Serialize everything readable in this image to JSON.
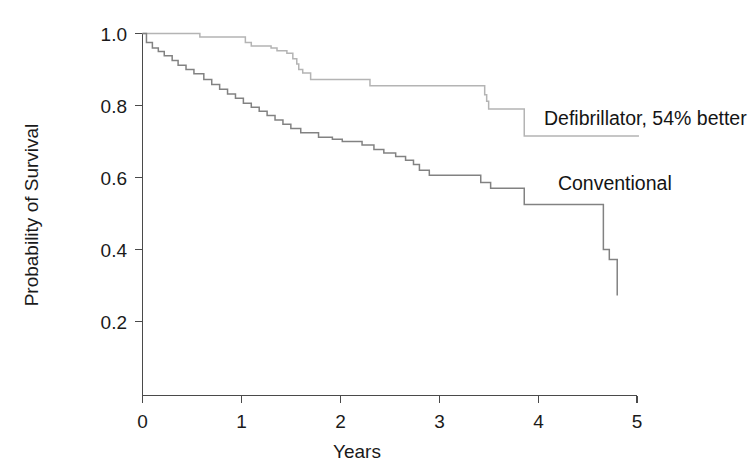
{
  "chart_data": {
    "type": "line",
    "title": "",
    "subtitle": "",
    "xlabel": "Years",
    "ylabel": "Probability of Survival",
    "xlim": [
      0,
      5
    ],
    "ylim": [
      0,
      1.05
    ],
    "xticks": [
      0,
      1,
      2,
      3,
      4,
      5
    ],
    "xtick_labels": [
      "0",
      "1",
      "2",
      "3",
      "4",
      "5"
    ],
    "yticks": [
      0.2,
      0.4,
      0.6,
      0.8,
      1.0
    ],
    "ytick_labels": [
      "0.2",
      "0.4",
      "0.6",
      "0.8",
      "1.0"
    ],
    "grid": false,
    "legend_position": "inline-annotation",
    "step_style": "post",
    "series": [
      {
        "name": "Defibrillator, 54% better",
        "color": "#b4b4b4",
        "annotation": "Defibrillator, 54% better",
        "annotation_x": 4.06,
        "annotation_y": 0.745,
        "x": [
          0.0,
          0.05,
          0.55,
          0.58,
          1.04,
          1.1,
          1.3,
          1.36,
          1.46,
          1.52,
          1.56,
          1.58,
          1.62,
          1.7,
          2.22,
          2.3,
          3.42,
          3.46,
          3.48,
          3.5,
          3.82,
          3.86,
          5.02
        ],
        "y": [
          1.0,
          1.0,
          1.0,
          0.99,
          0.975,
          0.965,
          0.96,
          0.952,
          0.945,
          0.93,
          0.915,
          0.9,
          0.89,
          0.872,
          0.872,
          0.855,
          0.855,
          0.83,
          0.812,
          0.79,
          0.79,
          0.715,
          0.715
        ]
      },
      {
        "name": "Conventional",
        "color": "#828282",
        "annotation": "Conventional",
        "annotation_x": 4.2,
        "annotation_y": 0.565,
        "x": [
          0.0,
          0.04,
          0.1,
          0.16,
          0.22,
          0.3,
          0.36,
          0.44,
          0.52,
          0.62,
          0.7,
          0.78,
          0.86,
          0.94,
          1.02,
          1.1,
          1.18,
          1.26,
          1.34,
          1.42,
          1.5,
          1.6,
          1.78,
          1.92,
          2.02,
          2.12,
          2.22,
          2.34,
          2.44,
          2.56,
          2.66,
          2.74,
          2.8,
          2.9,
          3.3,
          3.42,
          3.52,
          3.82,
          3.86,
          4.62,
          4.66,
          4.72,
          4.8
        ],
        "y": [
          1.0,
          0.975,
          0.96,
          0.95,
          0.938,
          0.925,
          0.912,
          0.9,
          0.888,
          0.872,
          0.858,
          0.845,
          0.832,
          0.82,
          0.806,
          0.795,
          0.784,
          0.772,
          0.76,
          0.748,
          0.736,
          0.724,
          0.712,
          0.706,
          0.7,
          0.7,
          0.69,
          0.678,
          0.668,
          0.658,
          0.648,
          0.636,
          0.62,
          0.606,
          0.606,
          0.586,
          0.57,
          0.57,
          0.525,
          0.525,
          0.4,
          0.372,
          0.272
        ]
      }
    ]
  },
  "axes": {
    "x_axis_name": "years-axis",
    "y_axis_name": "probability-axis"
  }
}
